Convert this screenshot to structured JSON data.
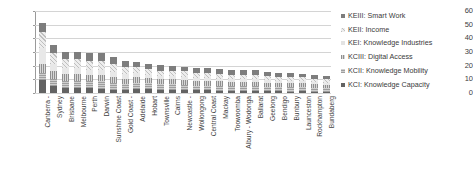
{
  "chart_data": {
    "type": "bar",
    "stacked": true,
    "title": "",
    "xlabel": "",
    "ylabel": "",
    "ylim": [
      0,
      60
    ],
    "yticks": [
      0,
      10,
      20,
      30,
      40,
      50,
      60
    ],
    "grid": true,
    "legend_position": "right",
    "categories": [
      "Canberra -",
      "Sydney",
      "Brisbane",
      "Melbourne",
      "Perth",
      "Darwin",
      "Sunshine Coast",
      "Gold Coast -",
      "Adelaide",
      "Hobart",
      "Townsville",
      "Cairns",
      "Newcastle -",
      "Wollongong",
      "Central Coast",
      "Mackay",
      "Toowoomba",
      "Albury - Wodonga",
      "Ballarat",
      "Geelong",
      "Bendigo",
      "Bunbury",
      "Launceston",
      "Rockhampton",
      "Bundaberg"
    ],
    "series": [
      {
        "name": "KCI: Knowledge Capacity",
        "values": [
          9.5,
          5.0,
          4.0,
          4.0,
          3.5,
          3.0,
          2.0,
          2.0,
          3.0,
          3.0,
          2.0,
          2.0,
          2.0,
          2.0,
          2.0,
          1.5,
          1.5,
          1.5,
          1.5,
          1.5,
          1.5,
          1.0,
          1.5,
          1.0,
          1.0
        ]
      },
      {
        "name": "KCII: Knowledge Mobility",
        "values": [
          5.5,
          5.5,
          5.0,
          5.0,
          5.0,
          5.5,
          5.0,
          4.5,
          4.5,
          4.0,
          4.5,
          4.5,
          4.0,
          3.5,
          3.5,
          4.0,
          3.5,
          3.5,
          3.5,
          3.0,
          3.0,
          3.5,
          3.0,
          3.0,
          2.5
        ]
      },
      {
        "name": "KCIII: Digital Access",
        "values": [
          6.0,
          5.5,
          5.0,
          5.0,
          4.5,
          4.5,
          4.5,
          4.0,
          4.0,
          4.0,
          3.5,
          3.5,
          3.5,
          3.5,
          3.5,
          3.0,
          3.0,
          3.0,
          3.0,
          3.0,
          3.0,
          3.0,
          2.5,
          2.5,
          2.5
        ]
      },
      {
        "name": "KEI: Knowledge Industries",
        "values": [
          12.0,
          5.5,
          4.5,
          4.5,
          4.0,
          4.0,
          4.0,
          3.5,
          3.0,
          2.5,
          2.5,
          2.5,
          2.5,
          2.0,
          2.0,
          2.0,
          2.0,
          2.0,
          2.0,
          2.0,
          1.5,
          1.5,
          1.5,
          1.5,
          1.5
        ]
      },
      {
        "name": "KEII: Income",
        "values": [
          12.0,
          8.0,
          6.5,
          6.5,
          6.5,
          6.5,
          5.5,
          5.0,
          4.5,
          4.0,
          4.0,
          4.0,
          4.0,
          4.0,
          3.5,
          3.5,
          3.5,
          3.5,
          3.5,
          3.0,
          3.0,
          3.0,
          3.0,
          2.5,
          2.5
        ]
      },
      {
        "name": "KEIII: Smart Work",
        "values": [
          6.0,
          5.5,
          5.0,
          5.0,
          5.5,
          5.5,
          5.5,
          4.5,
          3.5,
          3.5,
          4.0,
          3.5,
          3.0,
          3.5,
          3.5,
          3.5,
          3.5,
          3.0,
          3.0,
          3.0,
          3.0,
          3.0,
          2.5,
          2.5,
          2.5
        ]
      }
    ],
    "totals": [
      51.0,
      35.0,
      30.0,
      30.0,
      29.0,
      29.0,
      26.5,
      23.5,
      22.5,
      21.0,
      20.5,
      20.0,
      19.0,
      18.5,
      18.0,
      17.5,
      17.0,
      16.5,
      16.5,
      15.5,
      15.0,
      15.0,
      14.0,
      13.0,
      12.5
    ]
  },
  "legend": {
    "items": [
      {
        "label": "KEIII: Smart Work",
        "key": "keiii"
      },
      {
        "label": "KEII: Income",
        "key": "keii"
      },
      {
        "label": "KEI: Knowledge Industries",
        "key": "kei"
      },
      {
        "label": "KCIII: Digital Access",
        "key": "kciii"
      },
      {
        "label": "KCII: Knowledge Mobility",
        "key": "kcii"
      },
      {
        "label": "KCI: Knowledge Capacity",
        "key": "kci"
      }
    ]
  },
  "colors": {
    "kci": "#636363",
    "kcii": "#9e9e9e",
    "kciii": "#8f8f8f",
    "kei": "#e8e8e8",
    "keii": "#bfbfbf",
    "keiii": "#7d7d7d",
    "gridline": "#d4d4d4",
    "axis": "#9a9a9a",
    "text": "#3f3f3f"
  }
}
